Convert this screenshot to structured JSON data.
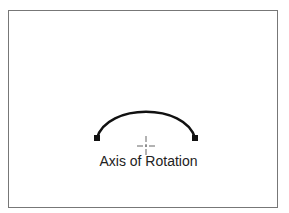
{
  "diagram": {
    "label": "Axis of Rotation",
    "arc": {
      "stroke": "#111111",
      "width": 2.6
    },
    "frame_color": "#777777"
  }
}
